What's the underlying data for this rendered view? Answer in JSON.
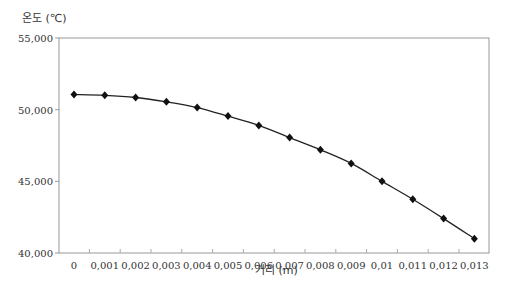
{
  "chart_data": {
    "type": "line",
    "title": "",
    "ylabel": "온도 (℃)",
    "xlabel": "거리 (m)",
    "ylim": [
      40000,
      55000
    ],
    "y_ticks": [
      "40,000",
      "45,000",
      "50,000",
      "55,000"
    ],
    "y_tick_values": [
      40000,
      45000,
      50000,
      55000
    ],
    "categories": [
      "0",
      "0.001",
      "0.002",
      "0.003",
      "0.004",
      "0.005",
      "0.006",
      "0.007",
      "0.008",
      "0.009",
      "0.01",
      "0.011",
      "0.012",
      "0.013"
    ],
    "x_tick_labels": [
      "0",
      "0,001",
      "0,002",
      "0,003",
      "0,004",
      "0,005",
      "0,006",
      "0,007",
      "0,008",
      "0,009",
      "0,01",
      "0,011",
      "0,012",
      "0,013"
    ],
    "series": [
      {
        "name": "온도",
        "marker": "diamond",
        "color": "#111111",
        "values": [
          51050,
          51000,
          50850,
          50550,
          50150,
          49550,
          48900,
          48050,
          47200,
          46250,
          45000,
          43750,
          42400,
          41000
        ]
      }
    ],
    "grid": false,
    "legend": "none"
  }
}
